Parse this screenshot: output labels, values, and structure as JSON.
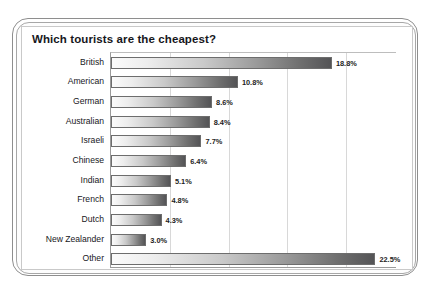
{
  "chart_data": {
    "type": "bar",
    "orientation": "horizontal",
    "title": "Which tourists are the cheapest?",
    "xlabel": "",
    "ylabel": "",
    "xlim": [
      0,
      24
    ],
    "grid": true,
    "gridlines": [
      5,
      10,
      15,
      20
    ],
    "legend": "none",
    "value_suffix": "%",
    "categories": [
      "British",
      "American",
      "German",
      "Australian",
      "Israeli",
      "Chinese",
      "Indian",
      "French",
      "Dutch",
      "New Zealander",
      "Other"
    ],
    "values": [
      18.8,
      10.8,
      8.6,
      8.4,
      7.7,
      6.4,
      5.1,
      4.8,
      4.3,
      3.0,
      22.5
    ],
    "labels": [
      "18.8%",
      "10.8%",
      "8.6%",
      "8.4%",
      "7.7%",
      "6.4%",
      "5.1%",
      "4.8%",
      "4.3%",
      "3.0%",
      "22.5%"
    ],
    "bar_gradient": {
      "start": "#fbfbfb",
      "end": "#545456",
      "border": "#6d6d6d"
    },
    "colors": {
      "frame_outer": "#8e8e8e",
      "frame_inner": "#a7a7a7",
      "card_background": "#ffffff",
      "grid": "#d8d8d8",
      "axis": "#9a9a9a",
      "text": "#17171c"
    }
  }
}
